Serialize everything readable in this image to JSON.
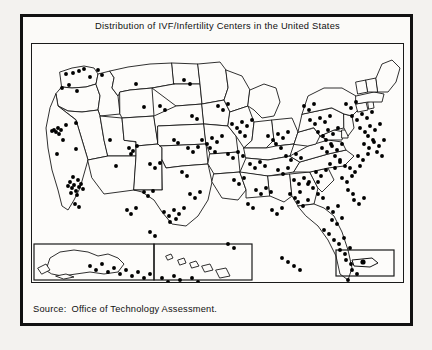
{
  "figure": {
    "title": "Distribution of IVF/Infertility Centers in the United States",
    "source_label": "Source:",
    "source_text": "Office of Technology Assessment.",
    "background_color": "#f3f2ef",
    "ink_color": "#111111",
    "paper_color": "#fdfcfa"
  },
  "map": {
    "name": "united-states-dot-distribution-map",
    "projection_note": "Contiguous United States with state outlines",
    "insets": [
      {
        "name": "alaska-inset",
        "label": ""
      },
      {
        "name": "hawaii-inset",
        "label": ""
      },
      {
        "name": "puerto-rico-inset",
        "label": ""
      }
    ]
  },
  "chart_data": {
    "type": "scatter",
    "title": "Distribution of IVF/Infertility Centers in the United States",
    "subtitle": "",
    "xlabel": "",
    "ylabel": "",
    "legend": [],
    "grid": false,
    "annotations": [
      "Source: Office of Technology Assessment."
    ],
    "marker": {
      "shape": "circle",
      "color": "#000000",
      "size": 2.6
    },
    "xlim": [
      0,
      373
    ],
    "ylim": [
      0,
      240
    ],
    "clusters": [
      {
        "region": "Northeast corridor (NY/NJ/PA)",
        "density": "very high"
      },
      {
        "region": "Southern California (Los Angeles)",
        "density": "very high"
      },
      {
        "region": "San Francisco Bay Area",
        "density": "high"
      },
      {
        "region": "Chicago / Great Lakes",
        "density": "high"
      },
      {
        "region": "Texas (Houston/Dallas/San Antonio)",
        "density": "high"
      },
      {
        "region": "Florida",
        "density": "moderate"
      },
      {
        "region": "Mountain West",
        "density": "low"
      }
    ],
    "points": [
      [
        34,
        30
      ],
      [
        41,
        29
      ],
      [
        47,
        27
      ],
      [
        52,
        25
      ],
      [
        58,
        33
      ],
      [
        66,
        26
      ],
      [
        70,
        31
      ],
      [
        30,
        44
      ],
      [
        37,
        41
      ],
      [
        45,
        47
      ],
      [
        22,
        86
      ],
      [
        24,
        88
      ],
      [
        26,
        84
      ],
      [
        27,
        90
      ],
      [
        20,
        87
      ],
      [
        29,
        86
      ],
      [
        34,
        81
      ],
      [
        44,
        79
      ],
      [
        31,
        96
      ],
      [
        25,
        110
      ],
      [
        44,
        105
      ],
      [
        38,
        138
      ],
      [
        42,
        141
      ],
      [
        46,
        136
      ],
      [
        40,
        144
      ],
      [
        44,
        147
      ],
      [
        36,
        142
      ],
      [
        49,
        140
      ],
      [
        41,
        133
      ],
      [
        47,
        143
      ],
      [
        39,
        149
      ],
      [
        45,
        151
      ],
      [
        51,
        145
      ],
      [
        43,
        160
      ],
      [
        47,
        163
      ],
      [
        78,
        96
      ],
      [
        84,
        122
      ],
      [
        104,
        40
      ],
      [
        112,
        63
      ],
      [
        97,
        104
      ],
      [
        101,
        107
      ],
      [
        105,
        102
      ],
      [
        99,
        110
      ],
      [
        142,
        96
      ],
      [
        146,
        99
      ],
      [
        128,
        62
      ],
      [
        133,
        66
      ],
      [
        118,
        120
      ],
      [
        123,
        124
      ],
      [
        128,
        119
      ],
      [
        112,
        148
      ],
      [
        116,
        152
      ],
      [
        121,
        147
      ],
      [
        95,
        166
      ],
      [
        99,
        170
      ],
      [
        104,
        164
      ],
      [
        132,
        168
      ],
      [
        137,
        172
      ],
      [
        142,
        166
      ],
      [
        147,
        170
      ],
      [
        152,
        164
      ],
      [
        144,
        175
      ],
      [
        138,
        178
      ],
      [
        118,
        188
      ],
      [
        123,
        192
      ],
      [
        152,
        36
      ],
      [
        158,
        40
      ],
      [
        160,
        72
      ],
      [
        165,
        75
      ],
      [
        156,
        104
      ],
      [
        161,
        108
      ],
      [
        166,
        103
      ],
      [
        150,
        128
      ],
      [
        155,
        132
      ],
      [
        158,
        150
      ],
      [
        163,
        154
      ],
      [
        168,
        148
      ],
      [
        170,
        96
      ],
      [
        175,
        100
      ],
      [
        180,
        94
      ],
      [
        185,
        98
      ],
      [
        190,
        92
      ],
      [
        178,
        104
      ],
      [
        183,
        108
      ],
      [
        186,
        62
      ],
      [
        191,
        66
      ],
      [
        196,
        60
      ],
      [
        200,
        80
      ],
      [
        205,
        84
      ],
      [
        210,
        78
      ],
      [
        215,
        82
      ],
      [
        220,
        76
      ],
      [
        208,
        88
      ],
      [
        213,
        92
      ],
      [
        196,
        110
      ],
      [
        201,
        114
      ],
      [
        206,
        108
      ],
      [
        211,
        112
      ],
      [
        218,
        120
      ],
      [
        223,
        124
      ],
      [
        228,
        118
      ],
      [
        233,
        122
      ],
      [
        202,
        136
      ],
      [
        207,
        140
      ],
      [
        212,
        134
      ],
      [
        224,
        146
      ],
      [
        229,
        150
      ],
      [
        234,
        144
      ],
      [
        239,
        148
      ],
      [
        216,
        160
      ],
      [
        221,
        164
      ],
      [
        236,
        92
      ],
      [
        241,
        96
      ],
      [
        246,
        90
      ],
      [
        251,
        94
      ],
      [
        256,
        88
      ],
      [
        244,
        100
      ],
      [
        249,
        104
      ],
      [
        254,
        112
      ],
      [
        259,
        116
      ],
      [
        264,
        110
      ],
      [
        269,
        114
      ],
      [
        246,
        126
      ],
      [
        251,
        130
      ],
      [
        256,
        124
      ],
      [
        262,
        136
      ],
      [
        267,
        140
      ],
      [
        272,
        134
      ],
      [
        277,
        138
      ],
      [
        258,
        150
      ],
      [
        263,
        154
      ],
      [
        268,
        148
      ],
      [
        240,
        166
      ],
      [
        245,
        170
      ],
      [
        250,
        164
      ],
      [
        272,
        62
      ],
      [
        277,
        66
      ],
      [
        282,
        60
      ],
      [
        278,
        76
      ],
      [
        283,
        80
      ],
      [
        288,
        74
      ],
      [
        293,
        78
      ],
      [
        298,
        72
      ],
      [
        286,
        88
      ],
      [
        291,
        92
      ],
      [
        296,
        86
      ],
      [
        301,
        90
      ],
      [
        306,
        84
      ],
      [
        294,
        96
      ],
      [
        299,
        100
      ],
      [
        290,
        104
      ],
      [
        295,
        108
      ],
      [
        300,
        102
      ],
      [
        305,
        106
      ],
      [
        310,
        100
      ],
      [
        303,
        112
      ],
      [
        308,
        116
      ],
      [
        298,
        120
      ],
      [
        303,
        124
      ],
      [
        308,
        118
      ],
      [
        313,
        122
      ],
      [
        284,
        128
      ],
      [
        289,
        132
      ],
      [
        294,
        126
      ],
      [
        276,
        140
      ],
      [
        281,
        144
      ],
      [
        286,
        138
      ],
      [
        266,
        158
      ],
      [
        271,
        162
      ],
      [
        276,
        156
      ],
      [
        286,
        150
      ],
      [
        291,
        154
      ],
      [
        296,
        164
      ],
      [
        301,
        168
      ],
      [
        306,
        162
      ],
      [
        300,
        176
      ],
      [
        305,
        180
      ],
      [
        310,
        174
      ],
      [
        292,
        186
      ],
      [
        297,
        190
      ],
      [
        302,
        196
      ],
      [
        307,
        200
      ],
      [
        312,
        194
      ],
      [
        314,
        60
      ],
      [
        319,
        64
      ],
      [
        324,
        58
      ],
      [
        320,
        72
      ],
      [
        325,
        76
      ],
      [
        330,
        70
      ],
      [
        335,
        74
      ],
      [
        340,
        68
      ],
      [
        328,
        84
      ],
      [
        333,
        88
      ],
      [
        338,
        82
      ],
      [
        343,
        86
      ],
      [
        348,
        80
      ],
      [
        336,
        92
      ],
      [
        341,
        96
      ],
      [
        332,
        100
      ],
      [
        337,
        104
      ],
      [
        342,
        98
      ],
      [
        347,
        102
      ],
      [
        352,
        96
      ],
      [
        345,
        108
      ],
      [
        350,
        112
      ],
      [
        326,
        112
      ],
      [
        331,
        116
      ],
      [
        336,
        110
      ],
      [
        318,
        124
      ],
      [
        323,
        128
      ],
      [
        328,
        122
      ],
      [
        310,
        134
      ],
      [
        315,
        138
      ],
      [
        320,
        132
      ],
      [
        316,
        146
      ],
      [
        321,
        150
      ],
      [
        322,
        156
      ],
      [
        327,
        160
      ],
      [
        332,
        154
      ],
      [
        308,
        206
      ],
      [
        313,
        210
      ],
      [
        318,
        204
      ],
      [
        314,
        216
      ],
      [
        319,
        220
      ],
      [
        320,
        226
      ],
      [
        325,
        230
      ],
      [
        316,
        236
      ],
      [
        321,
        240
      ],
      [
        58,
        222
      ],
      [
        64,
        226
      ],
      [
        70,
        220
      ],
      [
        76,
        228
      ],
      [
        82,
        224
      ],
      [
        88,
        230
      ],
      [
        94,
        226
      ],
      [
        100,
        232
      ],
      [
        106,
        228
      ],
      [
        112,
        234
      ],
      [
        118,
        230
      ],
      [
        130,
        234
      ],
      [
        136,
        238
      ],
      [
        142,
        232
      ],
      [
        148,
        236
      ],
      [
        154,
        240
      ],
      [
        160,
        234
      ],
      [
        166,
        238
      ],
      [
        250,
        214
      ],
      [
        256,
        218
      ],
      [
        262,
        222
      ],
      [
        268,
        226
      ],
      [
        196,
        200
      ],
      [
        202,
        204
      ]
    ]
  }
}
